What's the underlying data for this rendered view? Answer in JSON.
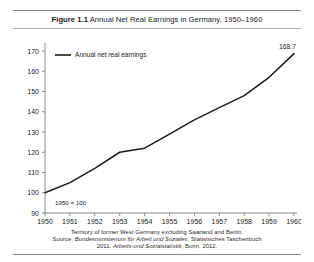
{
  "ghost_text": "· · · · · · · · · · · · · ·",
  "figure": {
    "label": "Figure 1.1",
    "title": "Annual Net Real Earnings in Germany, 1950–1960"
  },
  "notes": {
    "line1": "Territory of former West Germany excluding Saarland and Berlin.",
    "line2_prefix": "Source: ",
    "line2_italic": "Bundesministerium für Arbeit und Soziales",
    "line2_suffix": ", Statistisches Taschenbuch",
    "line3_prefix": "2011. ",
    "line3_italic": "Arbeits-und Sozialstatistik",
    "line3_suffix": ", Bonn, 2012."
  },
  "chart_data": {
    "type": "line",
    "title": "Annual Net Real Earnings in Germany, 1950–1960",
    "xlabel": "",
    "ylabel": "",
    "annotation": "1950 = 100",
    "legend_position": "top-left",
    "grid": false,
    "xlim": [
      1950,
      1960
    ],
    "ylim": [
      90,
      170
    ],
    "ytick_step": 10,
    "yticks": [
      90,
      100,
      110,
      120,
      130,
      140,
      150,
      160,
      170
    ],
    "categories": [
      1950,
      1951,
      1952,
      1953,
      1954,
      1955,
      1956,
      1957,
      1958,
      1959,
      1960
    ],
    "xtick_labels": [
      "1950",
      "1951",
      "1952",
      "1953",
      "1954",
      "1955",
      "1956",
      "1957",
      "1958",
      "1959",
      "1960"
    ],
    "series": [
      {
        "name": "Annual net real earnings",
        "color": "#1a1a1a",
        "values": [
          100.0,
          105.0,
          112.0,
          120.0,
          122.0,
          129.0,
          136.0,
          142.0,
          148.0,
          157.0,
          168.7
        ]
      }
    ],
    "point_labels": [
      {
        "x": 1960,
        "y": 168.7,
        "text": "168.7"
      }
    ]
  }
}
